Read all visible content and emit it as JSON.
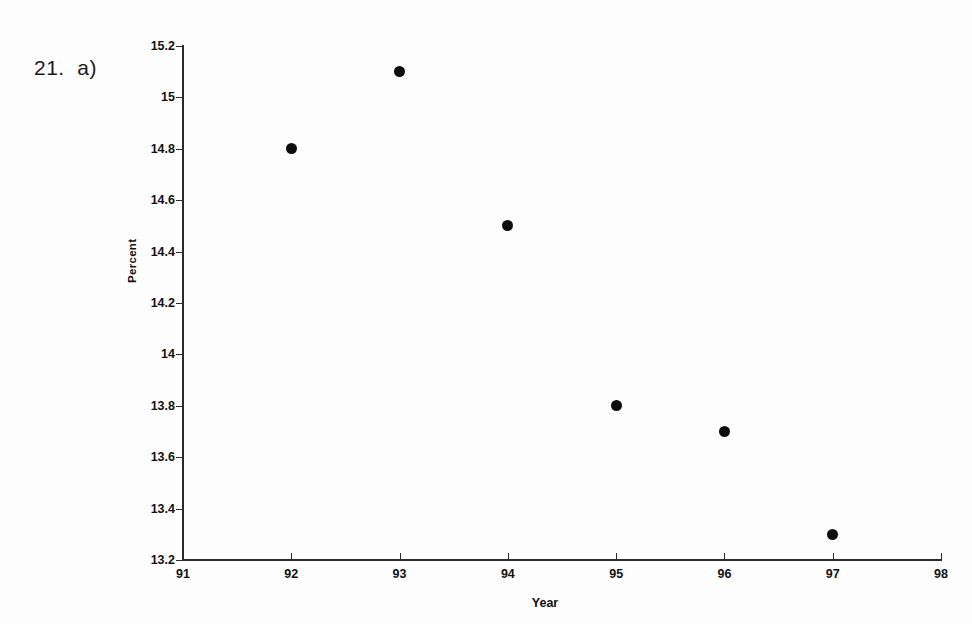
{
  "problem": {
    "label": "21.  a)"
  },
  "chart_data": {
    "type": "scatter",
    "title": "",
    "xlabel": "Year",
    "ylabel": "Percent",
    "x": [
      92,
      93,
      94,
      95,
      96,
      97
    ],
    "values": [
      14.8,
      15.1,
      14.5,
      13.8,
      13.7,
      13.3
    ],
    "points": [
      {
        "x": 92,
        "y": 14.8
      },
      {
        "x": 93,
        "y": 15.1
      },
      {
        "x": 94,
        "y": 14.5
      },
      {
        "x": 95,
        "y": 13.8
      },
      {
        "x": 96,
        "y": 13.7
      },
      {
        "x": 97,
        "y": 13.3
      }
    ],
    "xlim": [
      91,
      98
    ],
    "ylim": [
      13.2,
      15.2
    ],
    "x_ticks": [
      "91",
      "92",
      "93",
      "94",
      "95",
      "96",
      "97",
      "98"
    ],
    "x_tick_values": [
      91,
      92,
      93,
      94,
      95,
      96,
      97,
      98
    ],
    "y_ticks": [
      "15.2",
      "15",
      "14.8",
      "14.6",
      "14.4",
      "14.2",
      "14",
      "13.8",
      "13.6",
      "13.4",
      "13.2"
    ],
    "y_tick_values": [
      15.2,
      15.0,
      14.8,
      14.6,
      14.4,
      14.2,
      14.0,
      13.8,
      13.6,
      13.4,
      13.2
    ],
    "grid": false,
    "legend": false,
    "marker_color": "#0d0d0d",
    "axis_color": "#2b2b2b",
    "background": "#fdfdfd"
  }
}
